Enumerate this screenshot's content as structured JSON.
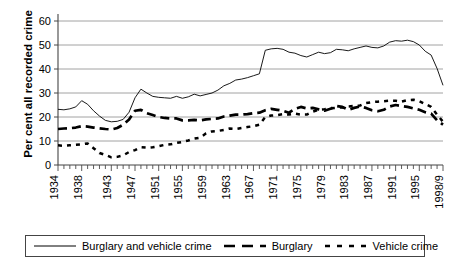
{
  "chart_data": {
    "type": "line",
    "title": "",
    "xlabel": "",
    "ylabel": "Per cent all recorded crime",
    "ylim": [
      0,
      60
    ],
    "yticks": [
      0,
      10,
      20,
      30,
      40,
      50,
      60
    ],
    "grid": true,
    "grid_axis": "y",
    "legend_position": "bottom",
    "x": [
      1934,
      1935,
      1936,
      1937,
      1938,
      1939,
      1940,
      1941,
      1942,
      1943,
      1944,
      1945,
      1946,
      1947,
      1948,
      1949,
      1950,
      1951,
      1952,
      1953,
      1954,
      1955,
      1956,
      1957,
      1958,
      1959,
      1960,
      1961,
      1962,
      1963,
      1964,
      1965,
      1966,
      1967,
      1968,
      1969,
      1970,
      1971,
      1972,
      1973,
      1974,
      1975,
      1976,
      1977,
      1978,
      1979,
      1980,
      1981,
      1982,
      1983,
      1984,
      1985,
      1986,
      1987,
      1988,
      1989,
      1990,
      1991,
      1992,
      1993,
      1994,
      1995,
      1996,
      1997,
      1998,
      1999
    ],
    "xtick_labels": [
      "1934",
      "1938",
      "1943",
      "1947",
      "1951",
      "1955",
      "1959",
      "1963",
      "1967",
      "1971",
      "1975",
      "1979",
      "1983",
      "1987",
      "1991",
      "1995",
      "1998/9"
    ],
    "xtick_values": [
      1934,
      1938,
      1943,
      1947,
      1951,
      1955,
      1959,
      1963,
      1967,
      1971,
      1975,
      1979,
      1983,
      1987,
      1991,
      1995,
      1999
    ],
    "series": [
      {
        "name": "Burglary and vehicle crime",
        "style": "solid",
        "color": "#000000",
        "values": [
          23.2,
          23.0,
          23.4,
          24.2,
          26.8,
          25.3,
          22.6,
          20.4,
          18.6,
          18.0,
          18.2,
          19.0,
          22.0,
          28.0,
          31.6,
          30.0,
          28.6,
          28.2,
          28.0,
          27.8,
          28.6,
          27.8,
          28.4,
          29.5,
          28.8,
          29.4,
          30.0,
          31.2,
          33.0,
          34.0,
          35.4,
          35.8,
          36.4,
          37.2,
          38.0,
          47.8,
          48.4,
          48.6,
          48.2,
          47.0,
          46.6,
          45.6,
          45.0,
          46.0,
          47.0,
          46.4,
          46.8,
          48.2,
          48.0,
          47.6,
          48.4,
          49.0,
          49.6,
          49.0,
          48.8,
          49.6,
          51.2,
          51.8,
          51.6,
          52.0,
          51.4,
          50.0,
          47.4,
          45.8,
          40.2,
          33.2
        ]
      },
      {
        "name": "Burglary",
        "style": "dashed",
        "color": "#000000",
        "values": [
          15.0,
          15.2,
          15.3,
          15.6,
          16.2,
          16.0,
          15.6,
          15.3,
          15.0,
          14.8,
          15.4,
          16.8,
          19.0,
          22.6,
          23.0,
          21.6,
          20.8,
          20.0,
          19.6,
          19.4,
          19.4,
          18.6,
          18.6,
          18.8,
          18.6,
          19.0,
          19.2,
          19.4,
          20.2,
          20.6,
          21.0,
          21.0,
          21.2,
          21.6,
          21.8,
          22.8,
          23.4,
          23.0,
          22.6,
          21.8,
          23.4,
          24.2,
          23.6,
          23.8,
          23.2,
          22.6,
          23.4,
          24.6,
          24.2,
          23.0,
          23.8,
          24.4,
          23.8,
          22.8,
          22.4,
          23.0,
          24.4,
          25.0,
          24.6,
          24.2,
          23.6,
          23.0,
          22.0,
          21.4,
          18.6,
          16.8
        ]
      },
      {
        "name": "Vehicle crime",
        "style": "dotted",
        "color": "#000000",
        "values": [
          8.2,
          8.0,
          8.2,
          8.4,
          8.6,
          9.0,
          7.0,
          5.0,
          4.2,
          3.2,
          3.4,
          4.0,
          5.4,
          6.2,
          7.4,
          7.2,
          7.4,
          7.8,
          8.4,
          8.6,
          9.2,
          9.6,
          10.2,
          11.0,
          11.4,
          13.2,
          14.0,
          14.2,
          14.6,
          15.2,
          15.0,
          15.4,
          15.8,
          16.2,
          16.8,
          20.0,
          20.6,
          20.8,
          21.2,
          21.0,
          21.4,
          21.0,
          21.0,
          22.2,
          23.0,
          23.2,
          23.6,
          23.8,
          24.0,
          24.4,
          24.6,
          24.8,
          25.8,
          26.2,
          26.4,
          26.6,
          26.8,
          26.8,
          26.4,
          27.0,
          27.2,
          26.6,
          25.4,
          24.2,
          21.0,
          18.0
        ]
      }
    ]
  },
  "legend": {
    "items": [
      {
        "label": "Burglary and vehicle crime",
        "style": "solid"
      },
      {
        "label": "Burglary",
        "style": "dashed"
      },
      {
        "label": "Vehicle crime",
        "style": "dotted"
      }
    ]
  },
  "axis": {
    "y_title": "Per cent all recorded crime"
  }
}
